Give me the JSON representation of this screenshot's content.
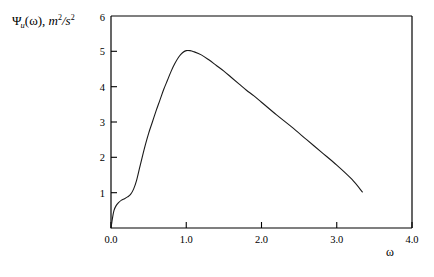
{
  "chart_data": {
    "type": "line",
    "title": "",
    "ylabel_text": "Ψ",
    "ylabel_subscript": "u",
    "ylabel_arg": "(ω),",
    "ylabel_units_base": "m",
    "ylabel_units_num_exp": "2",
    "ylabel_units_slash": "/s",
    "ylabel_units_den_exp": "2",
    "ylabel_full": "Ψu(ω), m2/s2",
    "xlabel": "ω",
    "xlim": [
      0.0,
      4.0
    ],
    "ylim": [
      0,
      6
    ],
    "xticks": [
      0.0,
      1.0,
      2.0,
      3.0,
      4.0
    ],
    "xtick_labels": [
      "0.0",
      "1.0",
      "2.0",
      "3.0",
      "4.0"
    ],
    "yticks": [
      1,
      2,
      3,
      4,
      5,
      6
    ],
    "ytick_labels": [
      "1",
      "2",
      "3",
      "4",
      "5",
      "6"
    ],
    "grid": false,
    "legend": "none",
    "line_color": "#1a1a1a",
    "line_width": 1.1,
    "frame_color": "#000000",
    "background": "#ffffff",
    "series": [
      {
        "name": "spectral-density",
        "points": [
          [
            0.0,
            0.0
          ],
          [
            0.02,
            0.28
          ],
          [
            0.04,
            0.5
          ],
          [
            0.07,
            0.64
          ],
          [
            0.1,
            0.72
          ],
          [
            0.14,
            0.79
          ],
          [
            0.18,
            0.83
          ],
          [
            0.22,
            0.88
          ],
          [
            0.26,
            0.95
          ],
          [
            0.3,
            1.1
          ],
          [
            0.34,
            1.35
          ],
          [
            0.38,
            1.7
          ],
          [
            0.42,
            2.05
          ],
          [
            0.46,
            2.38
          ],
          [
            0.5,
            2.68
          ],
          [
            0.55,
            3.0
          ],
          [
            0.6,
            3.32
          ],
          [
            0.65,
            3.62
          ],
          [
            0.7,
            3.92
          ],
          [
            0.75,
            4.18
          ],
          [
            0.8,
            4.44
          ],
          [
            0.85,
            4.66
          ],
          [
            0.9,
            4.84
          ],
          [
            0.95,
            4.96
          ],
          [
            1.0,
            5.02
          ],
          [
            1.05,
            5.02
          ],
          [
            1.1,
            4.99
          ],
          [
            1.2,
            4.9
          ],
          [
            1.3,
            4.76
          ],
          [
            1.4,
            4.6
          ],
          [
            1.5,
            4.44
          ],
          [
            1.6,
            4.26
          ],
          [
            1.7,
            4.08
          ],
          [
            1.8,
            3.9
          ],
          [
            1.9,
            3.74
          ],
          [
            2.0,
            3.56
          ],
          [
            2.2,
            3.2
          ],
          [
            2.4,
            2.86
          ],
          [
            2.6,
            2.5
          ],
          [
            2.8,
            2.14
          ],
          [
            3.0,
            1.78
          ],
          [
            3.2,
            1.38
          ],
          [
            3.34,
            1.02
          ]
        ]
      }
    ]
  },
  "axes_geometry": {
    "left_px": 111,
    "right_px": 412,
    "top_px": 16,
    "bottom_px": 228
  }
}
